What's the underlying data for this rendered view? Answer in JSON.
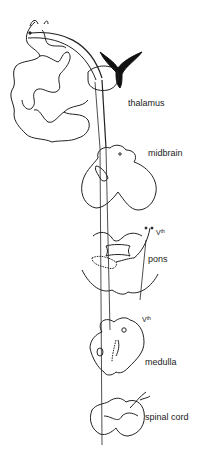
{
  "diagram": {
    "labels": {
      "thalamus": "thalamus",
      "midbrain": "midbrain",
      "pons": "pons",
      "nerve_pons": "V",
      "nerve_pons_sup": "th",
      "nerve_medulla": "V",
      "nerve_medulla_sup": "th",
      "medulla": "medulla",
      "spinal_cord": "spinal cord"
    },
    "colors": {
      "line": "#222222",
      "background": "#ffffff",
      "ventricle": "#111111"
    }
  }
}
